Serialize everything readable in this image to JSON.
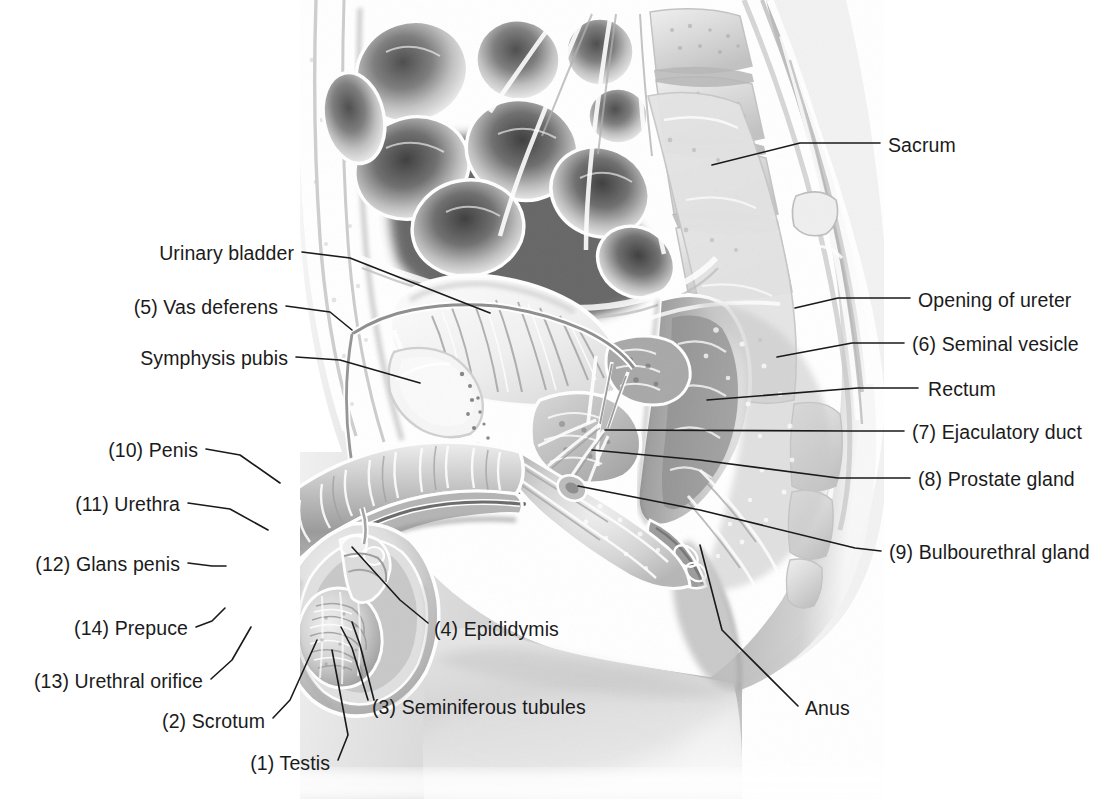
{
  "figure": {
    "background_color": "#ffffff",
    "text_color": "#1b1b1b",
    "leader_color": "#1a1a1a",
    "font_size_px": 19.5
  },
  "labels": [
    {
      "id": "sacrum",
      "text": "Sacrum",
      "side": "right",
      "text_x": 888,
      "text_y": 150,
      "leader": [
        [
          880,
          143
        ],
        [
          800,
          143
        ],
        [
          712,
          165
        ]
      ]
    },
    {
      "id": "opening-of-ureter",
      "text": "Opening of ureter",
      "side": "right",
      "text_x": 918,
      "text_y": 305,
      "leader": [
        [
          910,
          298
        ],
        [
          838,
          298
        ],
        [
          795,
          308
        ]
      ]
    },
    {
      "id": "seminal-vesicle",
      "text": "(6) Seminal vesicle",
      "side": "right",
      "text_x": 912,
      "text_y": 349,
      "leader": [
        [
          904,
          343
        ],
        [
          852,
          343
        ],
        [
          777,
          357
        ]
      ]
    },
    {
      "id": "rectum",
      "text": "Rectum",
      "side": "right",
      "text_x": 928,
      "text_y": 394,
      "leader": [
        [
          918,
          388
        ],
        [
          858,
          388
        ],
        [
          707,
          400
        ]
      ]
    },
    {
      "id": "ejaculatory-duct",
      "text": "(7) Ejaculatory duct",
      "side": "right",
      "text_x": 912,
      "text_y": 437,
      "leader": [
        [
          904,
          431
        ],
        [
          850,
          431
        ],
        [
          605,
          430
        ]
      ]
    },
    {
      "id": "prostate-gland",
      "text": "(8) Prostate gland",
      "side": "right",
      "text_x": 918,
      "text_y": 484,
      "leader": [
        [
          910,
          478
        ],
        [
          838,
          478
        ],
        [
          700,
          460
        ],
        [
          592,
          450
        ]
      ]
    },
    {
      "id": "bulbourethral-gland",
      "text": "(9) Bulbourethral gland",
      "side": "right",
      "text_x": 889,
      "text_y": 557,
      "leader": [
        [
          881,
          551
        ],
        [
          855,
          548
        ],
        [
          700,
          510
        ],
        [
          578,
          486
        ]
      ]
    },
    {
      "id": "anus",
      "text": "Anus",
      "side": "right",
      "text_x": 805,
      "text_y": 713,
      "leader": [
        [
          798,
          706
        ],
        [
          722,
          630
        ],
        [
          700,
          545
        ]
      ]
    },
    {
      "id": "urinary-bladder",
      "text": "Urinary bladder",
      "side": "left",
      "text_x": 294,
      "text_y": 258,
      "leader": [
        [
          302,
          252
        ],
        [
          350,
          258
        ],
        [
          490,
          313
        ]
      ]
    },
    {
      "id": "vas-deferens",
      "text": "(5) Vas deferens",
      "side": "left",
      "text_x": 278,
      "text_y": 312,
      "leader": [
        [
          286,
          306
        ],
        [
          330,
          312
        ],
        [
          352,
          330
        ]
      ]
    },
    {
      "id": "symphysis-pubis",
      "text": "Symphysis pubis",
      "side": "left",
      "text_x": 288,
      "text_y": 363,
      "leader": [
        [
          296,
          357
        ],
        [
          340,
          360
        ],
        [
          420,
          383
        ]
      ]
    },
    {
      "id": "penis",
      "text": "(10) Penis",
      "side": "left",
      "text_x": 198,
      "text_y": 455,
      "leader": [
        [
          206,
          449
        ],
        [
          240,
          455
        ],
        [
          280,
          483
        ]
      ]
    },
    {
      "id": "urethra",
      "text": "(11) Urethra",
      "side": "left",
      "text_x": 180,
      "text_y": 509,
      "leader": [
        [
          188,
          503
        ],
        [
          230,
          509
        ],
        [
          268,
          530
        ]
      ]
    },
    {
      "id": "glans-penis",
      "text": "(12) Glans penis",
      "side": "left",
      "text_x": 180,
      "text_y": 569,
      "leader": [
        [
          188,
          563
        ],
        [
          212,
          566
        ],
        [
          226,
          566
        ]
      ]
    },
    {
      "id": "prepuce",
      "text": "(14) Prepuce",
      "side": "left",
      "text_x": 188,
      "text_y": 633,
      "leader": [
        [
          196,
          627
        ],
        [
          212,
          621
        ],
        [
          225,
          608
        ]
      ]
    },
    {
      "id": "urethral-orifice",
      "text": "(13) Urethral orifice",
      "side": "left",
      "text_x": 203,
      "text_y": 686,
      "leader": [
        [
          211,
          679
        ],
        [
          232,
          660
        ],
        [
          251,
          627
        ]
      ]
    },
    {
      "id": "scrotum",
      "text": "(2) Scrotum",
      "side": "left",
      "text_x": 265,
      "text_y": 726,
      "leader": [
        [
          273,
          718
        ],
        [
          290,
          700
        ],
        [
          317,
          640
        ]
      ]
    },
    {
      "id": "testis",
      "text": "(1) Testis",
      "side": "left",
      "text_x": 330,
      "text_y": 768,
      "leader": [
        [
          338,
          760
        ],
        [
          348,
          735
        ],
        [
          332,
          650
        ]
      ]
    },
    {
      "id": "seminiferous-tubules",
      "text": "(3) Seminiferous tubules",
      "side": "right",
      "text_x": 372,
      "text_y": 712,
      "leader": [
        [
          368,
          700
        ],
        [
          352,
          648
        ],
        [
          341,
          627
        ]
      ],
      "leader2": [
        [
          374,
          700
        ],
        [
          360,
          645
        ],
        [
          352,
          622
        ]
      ]
    },
    {
      "id": "epididymis",
      "text": "(4) Epididymis",
      "side": "right",
      "text_x": 434,
      "text_y": 634,
      "leader": [
        [
          428,
          623
        ],
        [
          400,
          600
        ],
        [
          352,
          547
        ]
      ]
    }
  ],
  "illustration": {
    "type": "grayscale-medical-airbrush",
    "view": "midsagittal male pelvis",
    "structures": [
      "small intestine coils",
      "lumbar vertebrae",
      "sacrum",
      "urinary bladder",
      "symphysis pubis",
      "rectum",
      "seminal vesicle",
      "prostate gland",
      "ejaculatory duct",
      "bulbourethral gland",
      "anus",
      "penis shaft",
      "corpus cavernosum",
      "urethra",
      "glans penis",
      "prepuce",
      "urethral orifice",
      "scrotum",
      "testis",
      "epididymis",
      "seminiferous tubules",
      "vas deferens",
      "thigh"
    ],
    "tones": {
      "paper": "#ffffff",
      "lightest": "#f2f2f2",
      "light": "#dcdcdc",
      "mid_light": "#c4c4c4",
      "mid": "#a8a8a8",
      "mid_dark": "#8a8a8a",
      "dark": "#6a6a6a",
      "darkest": "#474747",
      "outline": "#5a5a5a"
    }
  }
}
